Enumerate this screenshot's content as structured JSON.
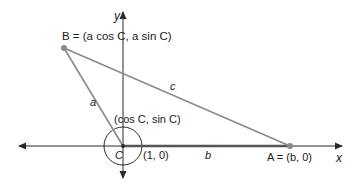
{
  "diagram": {
    "type": "law-of-cosines-coordinate-setup",
    "colors": {
      "axis": "#2a2a2a",
      "side": "#8a8a8a",
      "side_b": "#555555",
      "point": "#8a8a8a",
      "text": "#1a1a1a"
    },
    "axes": {
      "x_label": "x",
      "y_label": "y"
    },
    "points": {
      "B": {
        "label": "B = (a cos C, a sin C)"
      },
      "A": {
        "label": "A = (b, 0)"
      },
      "C": {
        "label": "C"
      },
      "unit_point": {
        "label": "(cos C, sin C)"
      },
      "one_zero": {
        "label": "(1, 0)"
      }
    },
    "sides": {
      "a": "a",
      "b": "b",
      "c": "c"
    }
  }
}
